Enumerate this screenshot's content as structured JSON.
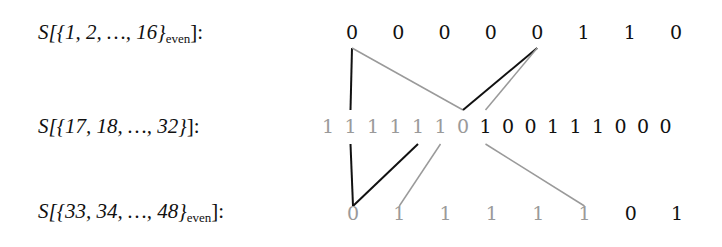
{
  "rows": [
    {
      "label_prefix": "S[{1, 2, …, 16}",
      "label_sub": "even",
      "label_suffix": "]:",
      "bits": [
        "0",
        "0",
        "0",
        "0",
        "0",
        "1",
        "1",
        "0"
      ],
      "shade": [
        "dark",
        "dark",
        "dark",
        "dark",
        "dark",
        "dark",
        "dark",
        "dark"
      ]
    },
    {
      "label_prefix": "S[{17, 18, …, 32}",
      "label_sub": "",
      "label_suffix": "]:",
      "bits": [
        "1",
        "1",
        "1",
        "1",
        "1",
        "1",
        "0",
        "1",
        "0",
        "0",
        "1",
        "1",
        "1",
        "0",
        "0",
        "0"
      ],
      "shade": [
        "gray",
        "gray",
        "gray",
        "gray",
        "gray",
        "gray",
        "gray",
        "dark",
        "dark",
        "dark",
        "dark",
        "dark",
        "dark",
        "dark",
        "dark",
        "dark"
      ]
    },
    {
      "label_prefix": "S[{33, 34, …, 48}",
      "label_sub": "even",
      "label_suffix": "]:",
      "bits": [
        "0",
        "1",
        "1",
        "1",
        "1",
        "1",
        "0",
        "1"
      ],
      "shade": [
        "gray",
        "gray",
        "gray",
        "gray",
        "gray",
        "gray",
        "dark",
        "dark"
      ]
    }
  ],
  "connections": [
    {
      "from": "top.0",
      "to": "mid.1",
      "color": "dark"
    },
    {
      "from": "top.0",
      "to": "mid.6",
      "color": "gray"
    },
    {
      "from": "top.4",
      "to": "mid.6",
      "color": "dark"
    },
    {
      "from": "top.4",
      "to": "mid.7",
      "color": "gray"
    },
    {
      "from": "mid.1",
      "to": "bot.0",
      "color": "dark"
    },
    {
      "from": "mid.4",
      "to": "bot.0",
      "color": "dark"
    },
    {
      "from": "mid.5",
      "to": "bot.1",
      "color": "gray"
    },
    {
      "from": "mid.7",
      "to": "bot.5",
      "color": "gray"
    }
  ],
  "colors": {
    "dark": "#111111",
    "gray": "#9a9a9a"
  }
}
